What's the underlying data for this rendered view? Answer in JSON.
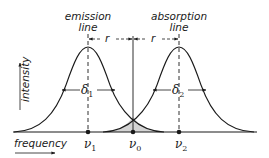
{
  "labels": {
    "emission_line_1": "emission",
    "emission_line_2": "line",
    "absorption_line_1": "absorption",
    "absorption_line_2": "line",
    "y_axis": "intensity",
    "x_axis": "frequency",
    "r_left": "r",
    "r_right": "r",
    "delta1": "δ",
    "delta1_sub": "1",
    "delta2": "δ",
    "delta2_sub": "2",
    "nu1": "ν",
    "nu1_sub": "1",
    "nu0": "ν",
    "nu0_sub": "0",
    "nu2": "ν",
    "nu2_sub": "2"
  },
  "colors": {
    "line": "#1a1a1a",
    "overlap_fill": "#d4d4d4"
  }
}
